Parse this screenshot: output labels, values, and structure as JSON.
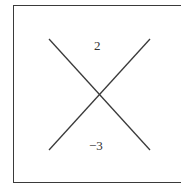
{
  "diagram": {
    "type": "crossing-lines",
    "labels": {
      "top": "2",
      "bottom": "−3"
    },
    "colors": {
      "line": "#3a3a3a",
      "border": "#3a3a3a",
      "text": "#333333"
    }
  }
}
